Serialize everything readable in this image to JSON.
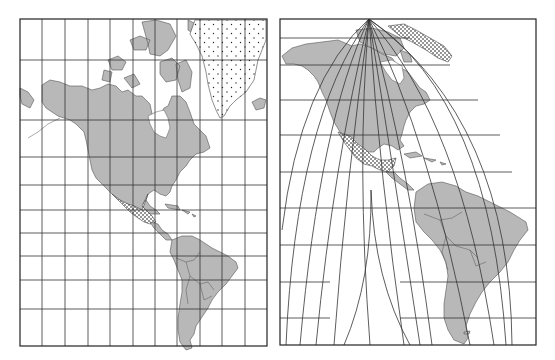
{
  "figure": {
    "panels": [
      {
        "id": "left",
        "projection_style": "rectangular grid (cylindrical)",
        "frame": {
          "x": 20,
          "y": 19,
          "width": 247,
          "height": 327
        },
        "meridian_x": [
          20,
          42,
          65,
          88,
          110,
          133,
          155,
          177,
          200,
          222,
          245,
          267
        ],
        "parallel_y": [
          19,
          60,
          120,
          157,
          185,
          210,
          233,
          256,
          280,
          309,
          346
        ],
        "highlighted_regions": [
          "Greenland (dotted)",
          "Mexico (dotted)"
        ]
      },
      {
        "id": "right",
        "projection_style": "curved meridians converging at pole (polyconic-like)",
        "frame": {
          "x": 280,
          "y": 19,
          "width": 256,
          "height": 326
        },
        "pole": {
          "x": 369,
          "y": 19
        },
        "parallel_y": [
          38,
          65,
          100,
          135,
          172,
          208,
          245,
          282,
          318
        ],
        "highlighted_regions": [
          "Greenland (dotted)",
          "Mexico (dotted)"
        ]
      }
    ],
    "colors": {
      "land": "#b8b8b8",
      "water": "#ffffff",
      "grid": "#333333",
      "frame": "#222222"
    }
  }
}
